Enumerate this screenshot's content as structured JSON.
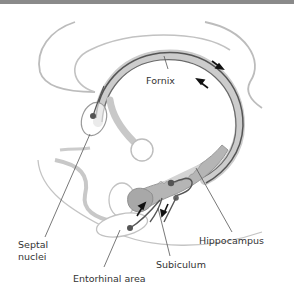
{
  "diagram": {
    "labels": {
      "fornix": "Fornix",
      "septal_line1": "Septal",
      "septal_line2": "nuclei",
      "hippocampus": "Hippocampus",
      "subiculum": "Subiculum",
      "entorhinal": "Entorhinal area"
    },
    "colors": {
      "outline": "#b8b8b8",
      "fornix_fill": "#c4c4c4",
      "tract": "#5a5a5a",
      "hippocampus_fill": "#b0b0b0",
      "text": "#333333",
      "topbar": "#8a8a8a"
    }
  }
}
